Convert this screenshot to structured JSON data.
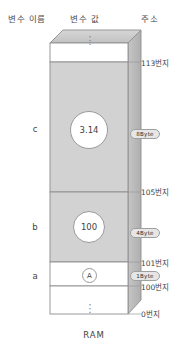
{
  "headers": {
    "name": "변수 이름",
    "value": "변수 값",
    "address": "주소"
  },
  "caption": "RAM",
  "ellipsis": "⋮",
  "memory": {
    "cells": [
      {
        "var": "c",
        "value": "3.14",
        "size": "8Byte"
      },
      {
        "var": "b",
        "value": "100",
        "size": "4Byte"
      },
      {
        "var": "a",
        "value": "A",
        "size": "1Byte"
      }
    ],
    "addresses": [
      {
        "id": "top",
        "label": "113번지"
      },
      {
        "id": "c-start",
        "label": "105번지"
      },
      {
        "id": "b-start",
        "label": "101번지"
      },
      {
        "id": "a-start",
        "label": "100번지"
      },
      {
        "id": "bottom",
        "label": "0번지"
      }
    ]
  },
  "colors": {
    "fill_light": "#ffffff",
    "fill_mid": "#d2d2d2",
    "fill_lid": "#c9c9c9",
    "fill_side": "#bdbdbd",
    "stroke": "#8e8e8e",
    "pill_bg": "#e6e6e6",
    "text": "#3f3f3f"
  }
}
